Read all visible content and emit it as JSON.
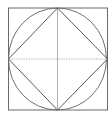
{
  "diagram": {
    "type": "geometric-construction",
    "canvas": {
      "width": 111,
      "height": 117,
      "background": "#ffffff"
    },
    "shapes": {
      "outer_square": {
        "x": 8.5,
        "y": 8,
        "width": 99,
        "height": 102,
        "stroke": "#6a6a6a"
      },
      "inscribed_circle": {
        "cx": 57.5,
        "cy": 59,
        "rx": 49,
        "ry": 51,
        "stroke": "#707070"
      },
      "inscribed_diamond": {
        "points": [
          [
            57.5,
            8
          ],
          [
            107.5,
            59
          ],
          [
            57.5,
            110
          ],
          [
            8.5,
            59
          ]
        ],
        "stroke": "#5a5a5a"
      },
      "horizontal_diameter": {
        "x1": 8.5,
        "y1": 59,
        "x2": 107.5,
        "y2": 59,
        "stroke": "#b8b8b8",
        "style": "dashed"
      },
      "vertical_diameter": {
        "x1": 57.5,
        "y1": 8,
        "x2": 57.5,
        "y2": 110,
        "stroke": "#b0b0b0",
        "style": "solid"
      }
    }
  }
}
